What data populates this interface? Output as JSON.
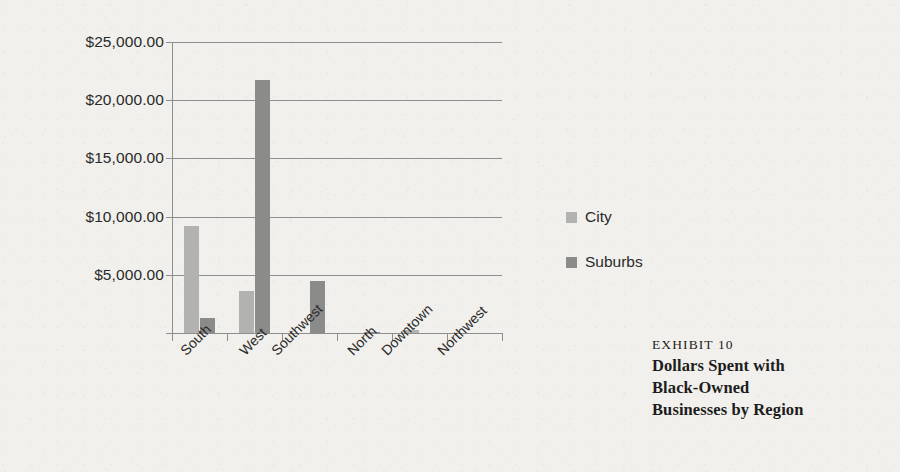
{
  "figure": {
    "background_color": "#f1f0ec",
    "text_color": "#2a2a2a"
  },
  "chart_data": {
    "type": "bar",
    "title": "",
    "subtitle": "",
    "xlabel": "",
    "ylabel": "",
    "categories": [
      "South",
      "West",
      "Southwest",
      "North",
      "Downtown",
      "Northwest"
    ],
    "series": [
      {
        "name": "City",
        "color": "#b2b2b0",
        "values": [
          9200,
          3600,
          0,
          0,
          300,
          0
        ]
      },
      {
        "name": "Suburbs",
        "color": "#8b8b89",
        "values": [
          1300,
          21700,
          4500,
          80,
          0,
          0
        ]
      }
    ],
    "ylim": [
      0,
      25000
    ],
    "yticks": [
      0,
      5000,
      10000,
      15000,
      20000,
      25000
    ],
    "ytick_labels": [
      "",
      "$5,000.00",
      "$10,000.00",
      "$15,000.00",
      "$20,000.00",
      "$25,000.00"
    ],
    "grid": true,
    "grid_axis": "y",
    "legend_position": "right",
    "x_tick_label_rotation": -45
  },
  "legend": {
    "items": [
      {
        "label": "City",
        "color": "#b2b2b0"
      },
      {
        "label": "Suburbs",
        "color": "#8b8b89"
      }
    ]
  },
  "caption": {
    "exhibit": "EXHIBIT 10",
    "lines": [
      "Dollars Spent with",
      "Black-Owned",
      "Businesses by Region"
    ]
  }
}
